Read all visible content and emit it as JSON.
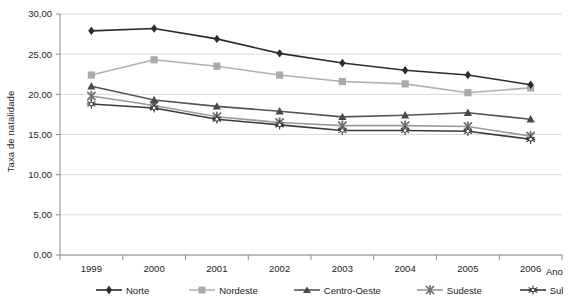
{
  "chart_data": {
    "type": "line",
    "title": "",
    "xlabel": "Ano",
    "ylabel": "Taxa de natalidade",
    "categories": [
      "1999",
      "2000",
      "2001",
      "2002",
      "2003",
      "2004",
      "2005",
      "2006"
    ],
    "ylim": [
      0,
      30
    ],
    "ytick_labels": [
      "0,00",
      "5,00",
      "10,00",
      "15,00",
      "20,00",
      "25,00",
      "30,00"
    ],
    "ytick_values": [
      0,
      5,
      10,
      15,
      20,
      25,
      30
    ],
    "grid": true,
    "legend_position": "bottom",
    "series": [
      {
        "name": "Norte",
        "color": "#2b2b2b",
        "marker": "diamond",
        "values": [
          27.9,
          28.2,
          26.9,
          25.1,
          23.9,
          23.0,
          22.4,
          21.2
        ]
      },
      {
        "name": "Nordeste",
        "color": "#b0b0b0",
        "marker": "square",
        "values": [
          22.4,
          24.3,
          23.5,
          22.4,
          21.6,
          21.3,
          20.2,
          20.8
        ]
      },
      {
        "name": "Centro-Oeste",
        "color": "#555555",
        "marker": "triangle",
        "values": [
          21.0,
          19.3,
          18.5,
          17.9,
          17.2,
          17.4,
          17.7,
          16.9
        ]
      },
      {
        "name": "Sudeste",
        "color": "#9a9a9a",
        "marker": "star-x",
        "values": [
          19.8,
          18.6,
          17.2,
          16.5,
          16.1,
          16.1,
          16.0,
          14.8
        ]
      },
      {
        "name": "Sul",
        "color": "#3a3a3a",
        "marker": "star-outline",
        "values": [
          18.8,
          18.3,
          16.9,
          16.2,
          15.5,
          15.5,
          15.4,
          14.4
        ]
      }
    ]
  },
  "axes": {
    "y_title": "Taxa de natalidade",
    "x_title": "Ano"
  },
  "legend": {
    "items": [
      {
        "label": "Norte"
      },
      {
        "label": "Nordeste"
      },
      {
        "label": "Centro-Oeste"
      },
      {
        "label": "Sudeste"
      },
      {
        "label": "Sul"
      }
    ]
  },
  "colors": {
    "grid": "#d9d9d9",
    "axis": "#8c8c8c",
    "text": "#1c1c1c",
    "background": "#ffffff"
  }
}
